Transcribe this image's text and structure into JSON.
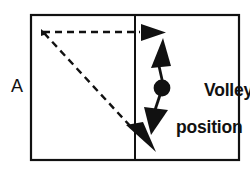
{
  "figure": {
    "panel_label": "A",
    "background_color": "#ffffff",
    "ink_color": "#111111"
  },
  "court": {
    "name": "court-rectangle",
    "x": 31,
    "y": 15,
    "width": 208,
    "height": 145,
    "stroke_color": "#111111",
    "stroke_width": 2.2,
    "net_line": {
      "name": "net-line",
      "x": 135,
      "y_top": 15,
      "y_bottom": 160,
      "stroke_width": 2.0
    }
  },
  "annotations": {
    "volley_position_label": {
      "line1": "Volley",
      "line2": "position"
    },
    "panel_letter": "A"
  },
  "markers": {
    "volley_dot": {
      "name": "volley-position-dot",
      "cx": 162,
      "cy": 88,
      "r": 8.4,
      "fill": "#111111"
    }
  },
  "paths": {
    "ball_horizontal": {
      "name": "dashed-horizontal-ball-path",
      "style": "dashed",
      "from_x": 43,
      "from_y": 32,
      "to_x": 139,
      "to_y": 32,
      "dash": "7 5",
      "stroke_width": 2.4,
      "arrowhead": "right"
    },
    "ball_diagonal": {
      "name": "dashed-diagonal-ball-path",
      "style": "dashed",
      "from_x": 43,
      "from_y": 32,
      "to_x": 131,
      "to_y": 126,
      "dash": "7 5",
      "stroke_width": 2.4,
      "arrowhead": "down-right"
    },
    "movement_up": {
      "name": "solid-up-movement-arrow",
      "style": "solid",
      "from_x": 163,
      "from_y": 83,
      "to_x": 159,
      "to_y": 64,
      "stroke_width": 2.6,
      "arrowhead": "up"
    },
    "movement_down": {
      "name": "solid-down-movement-arrow",
      "style": "solid",
      "from_x": 161,
      "from_y": 93,
      "to_x": 155,
      "to_y": 112,
      "stroke_width": 2.6,
      "arrowhead": "down"
    }
  },
  "arrowheads": {
    "horizontal_tip": {
      "name": "arrowhead-right",
      "tip_x": 164,
      "tip_y": 32
    },
    "diagonal_tip": {
      "name": "arrowhead-down-right",
      "tip_x": 153,
      "tip_y": 151
    },
    "up_tip": {
      "name": "arrowhead-up",
      "tip_x": 161,
      "tip_y": 38
    },
    "down_tip": {
      "name": "arrowhead-down",
      "tip_x": 150,
      "tip_y": 134
    }
  }
}
